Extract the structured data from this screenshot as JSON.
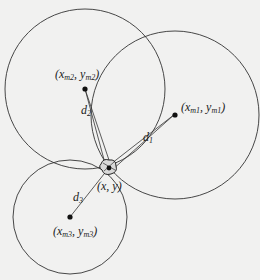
{
  "diagram": {
    "colors": {
      "background": "#f1f1f0",
      "stroke": "#333333",
      "point": "#111111"
    },
    "circles": [
      {
        "id": "m1",
        "cx": 175,
        "cy": 115,
        "r": 84
      },
      {
        "id": "m2",
        "cx": 85,
        "cy": 89,
        "r": 80
      },
      {
        "id": "m3",
        "cx": 70,
        "cy": 217,
        "r": 57
      }
    ],
    "estimate": {
      "x": 109,
      "y": 167,
      "label": "(x, y)"
    },
    "centers": [
      {
        "id": "m1",
        "label_x": "x",
        "label_xsub": "m1",
        "label_y": "y",
        "label_ysub": "m1"
      },
      {
        "id": "m2",
        "label_x": "x",
        "label_xsub": "m2",
        "label_y": "y",
        "label_ysub": "m2"
      },
      {
        "id": "m3",
        "label_x": "x",
        "label_xsub": "m3",
        "label_y": "y",
        "label_ysub": "m3"
      }
    ],
    "distances": [
      {
        "label": "d",
        "sub": "1"
      },
      {
        "label": "d",
        "sub": "2"
      },
      {
        "label": "d",
        "sub": "3"
      }
    ]
  }
}
